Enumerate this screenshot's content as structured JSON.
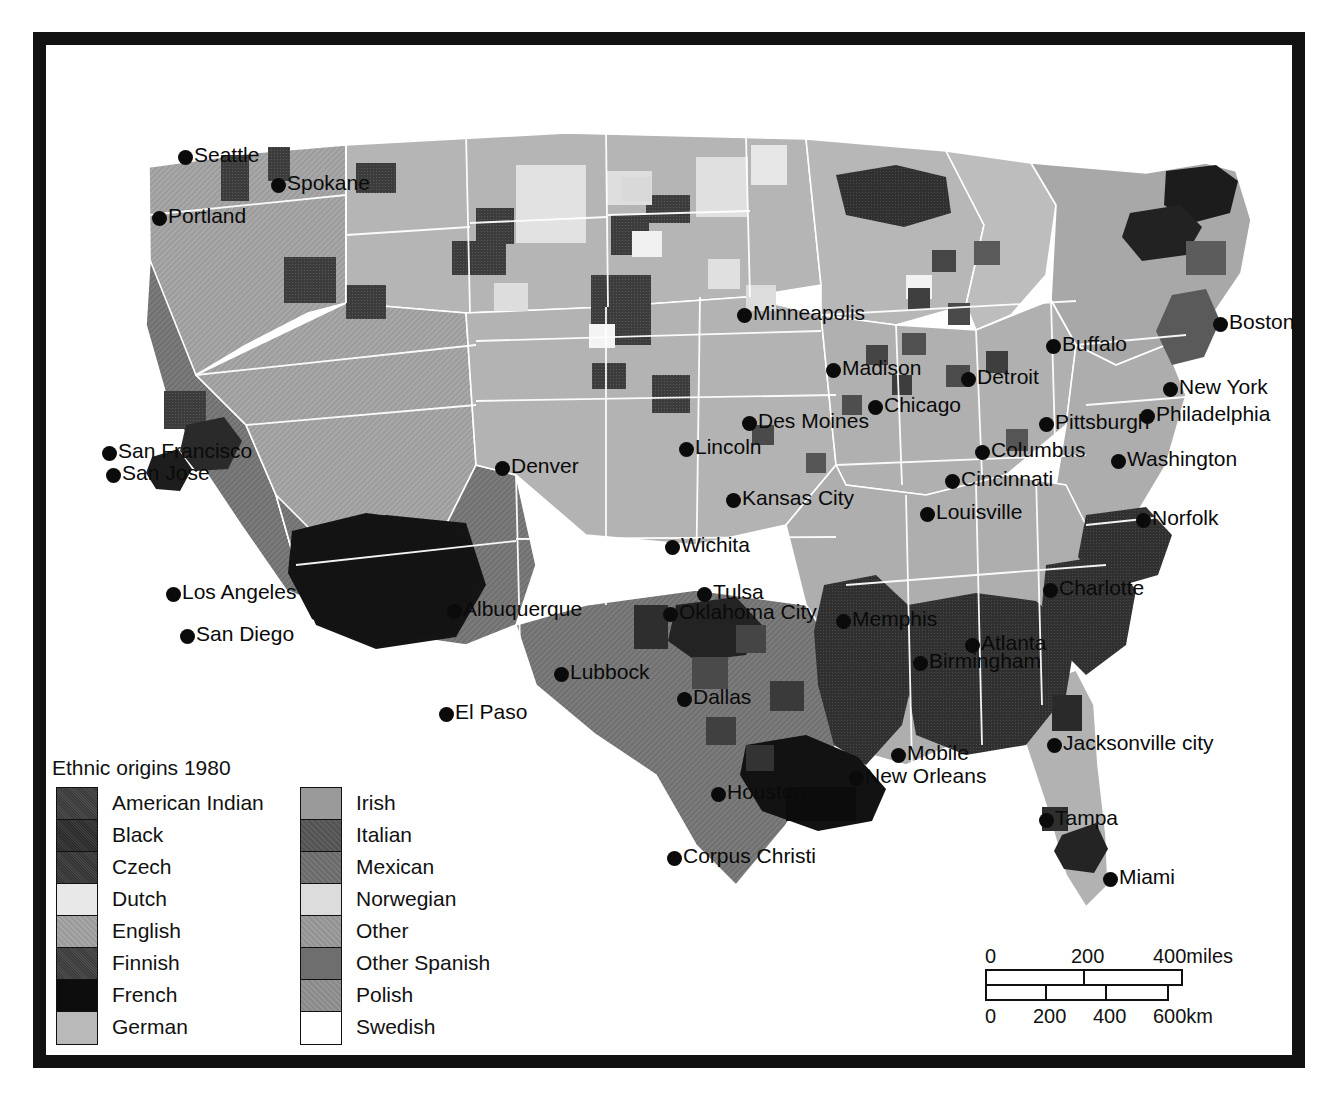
{
  "map": {
    "title": "Ethnic origins 1980",
    "projection_note": "",
    "ocean_color": "#ffffff",
    "border_color": "#121212"
  },
  "legend": {
    "title": "Ethnic origins 1980",
    "column_left": [
      {
        "label": "American Indian",
        "color": "#3a3a3a",
        "pattern": "speckle"
      },
      {
        "label": "Black",
        "color": "#2b2b2b",
        "pattern": "speckle"
      },
      {
        "label": "Czech",
        "color": "#343434",
        "pattern": "speckle"
      },
      {
        "label": "Dutch",
        "color": "#e8e8e8",
        "pattern": "solid"
      },
      {
        "label": "English",
        "color": "#a6a6a6",
        "pattern": "hatch"
      },
      {
        "label": "Finnish",
        "color": "#3b3b3b",
        "pattern": "speckle"
      },
      {
        "label": "French",
        "color": "#0d0d0d",
        "pattern": "solid"
      },
      {
        "label": "German",
        "color": "#b9b9b9",
        "pattern": "solid"
      }
    ],
    "column_right": [
      {
        "label": "Irish",
        "color": "#9a9a9a",
        "pattern": "solid"
      },
      {
        "label": "Italian",
        "color": "#5e5e5e",
        "pattern": "hatch"
      },
      {
        "label": "Mexican",
        "color": "#767676",
        "pattern": "hatch"
      },
      {
        "label": "Norwegian",
        "color": "#dcdcdc",
        "pattern": "solid"
      },
      {
        "label": "Other",
        "color": "#9e9e9e",
        "pattern": "hatch"
      },
      {
        "label": "Other Spanish",
        "color": "#6e6e6e",
        "pattern": "solid"
      },
      {
        "label": "Polish",
        "color": "#959595",
        "pattern": "hatch"
      },
      {
        "label": "Swedish",
        "color": "#ffffff",
        "pattern": "solid"
      }
    ]
  },
  "scalebar": {
    "miles_ticks": [
      "0",
      "200",
      "400miles"
    ],
    "km_ticks": [
      "0",
      "200",
      "400",
      "600km"
    ]
  },
  "cities": [
    {
      "name": "Seattle",
      "x": 178,
      "y": 144,
      "side": "right"
    },
    {
      "name": "Spokane",
      "x": 271,
      "y": 172,
      "side": "right"
    },
    {
      "name": "Portland",
      "x": 152,
      "y": 205,
      "side": "right"
    },
    {
      "name": "Minneapolis",
      "x": 737,
      "y": 302,
      "side": "right"
    },
    {
      "name": "Buffalo",
      "x": 1046,
      "y": 333,
      "side": "right"
    },
    {
      "name": "Boston",
      "x": 1213,
      "y": 311,
      "side": "right"
    },
    {
      "name": "Madison",
      "x": 826,
      "y": 357,
      "side": "right"
    },
    {
      "name": "Detroit",
      "x": 961,
      "y": 366,
      "side": "right"
    },
    {
      "name": "Chicago",
      "x": 868,
      "y": 394,
      "side": "right"
    },
    {
      "name": "New York",
      "x": 1163,
      "y": 376,
      "side": "right"
    },
    {
      "name": "Des Moines",
      "x": 742,
      "y": 410,
      "side": "right"
    },
    {
      "name": "Pittsburgh",
      "x": 1039,
      "y": 411,
      "side": "right"
    },
    {
      "name": "Philadelphia",
      "x": 1140,
      "y": 403,
      "side": "right"
    },
    {
      "name": "Lincoln",
      "x": 679,
      "y": 436,
      "side": "right"
    },
    {
      "name": "Columbus",
      "x": 975,
      "y": 439,
      "side": "right"
    },
    {
      "name": "San Francisco",
      "x": 102,
      "y": 440,
      "side": "right"
    },
    {
      "name": "Washington",
      "x": 1111,
      "y": 448,
      "side": "right"
    },
    {
      "name": "Denver",
      "x": 495,
      "y": 455,
      "side": "right"
    },
    {
      "name": "San Jose",
      "x": 106,
      "y": 462,
      "side": "right"
    },
    {
      "name": "Cincinnati",
      "x": 945,
      "y": 468,
      "side": "right"
    },
    {
      "name": "Kansas City",
      "x": 726,
      "y": 487,
      "side": "right"
    },
    {
      "name": "Louisville",
      "x": 920,
      "y": 501,
      "side": "right"
    },
    {
      "name": "Norfolk",
      "x": 1136,
      "y": 507,
      "side": "right"
    },
    {
      "name": "Wichita",
      "x": 665,
      "y": 534,
      "side": "right"
    },
    {
      "name": "Los Angeles",
      "x": 166,
      "y": 581,
      "side": "right"
    },
    {
      "name": "Charlotte",
      "x": 1043,
      "y": 577,
      "side": "right"
    },
    {
      "name": "Tulsa",
      "x": 697,
      "y": 581,
      "side": "right"
    },
    {
      "name": "Albuquerque",
      "x": 447,
      "y": 598,
      "side": "right"
    },
    {
      "name": "Oklahoma City",
      "x": 663,
      "y": 601,
      "side": "right"
    },
    {
      "name": "Memphis",
      "x": 836,
      "y": 608,
      "side": "right"
    },
    {
      "name": "San Diego",
      "x": 180,
      "y": 623,
      "side": "right"
    },
    {
      "name": "Atlanta",
      "x": 965,
      "y": 632,
      "side": "right"
    },
    {
      "name": "Birmingham",
      "x": 913,
      "y": 650,
      "side": "right"
    },
    {
      "name": "Lubbock",
      "x": 554,
      "y": 661,
      "side": "right"
    },
    {
      "name": "Dallas",
      "x": 677,
      "y": 686,
      "side": "right"
    },
    {
      "name": "El Paso",
      "x": 439,
      "y": 701,
      "side": "right"
    },
    {
      "name": "Mobile",
      "x": 891,
      "y": 742,
      "side": "right"
    },
    {
      "name": "Jacksonville city",
      "x": 1047,
      "y": 732,
      "side": "right"
    },
    {
      "name": "New Orleans",
      "x": 849,
      "y": 765,
      "side": "right"
    },
    {
      "name": "Houston",
      "x": 711,
      "y": 781,
      "side": "right"
    },
    {
      "name": "Tampa",
      "x": 1039,
      "y": 807,
      "side": "right"
    },
    {
      "name": "Corpus Christi",
      "x": 667,
      "y": 845,
      "side": "right"
    },
    {
      "name": "Miami",
      "x": 1103,
      "y": 866,
      "side": "right"
    }
  ]
}
